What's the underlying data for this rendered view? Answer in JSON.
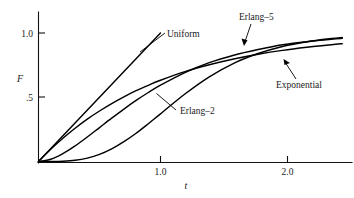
{
  "chart_data": {
    "type": "line",
    "title": "",
    "subtitle": "",
    "xlabel": "t",
    "ylabel": "F",
    "xlim": [
      0,
      2.49
    ],
    "ylim": [
      0,
      1.04
    ],
    "grid": false,
    "legend_position": "inline-annotations",
    "x_ticks": [
      {
        "value": 1.0,
        "label": "1.0"
      },
      {
        "value": 2.0,
        "label": "2.0"
      }
    ],
    "y_ticks": [
      {
        "value": 0.5,
        "label": ".5"
      },
      {
        "value": 1.0,
        "label": "1.0"
      }
    ],
    "series": [
      {
        "name": "Uniform",
        "label": "Uniform",
        "x": [
          0.0,
          0.1,
          0.2,
          0.3,
          0.4,
          0.5,
          0.6,
          0.7,
          0.8,
          0.9,
          1.0
        ],
        "values": [
          0.0,
          0.1,
          0.2,
          0.3,
          0.4,
          0.5,
          0.6,
          0.7,
          0.8,
          0.9,
          1.0
        ]
      },
      {
        "name": "Exponential",
        "label": "Exponential",
        "x": [
          0.0,
          0.1,
          0.2,
          0.3,
          0.4,
          0.5,
          0.6,
          0.7,
          0.8,
          0.9,
          1.0,
          1.2,
          1.4,
          1.6,
          1.8,
          2.0,
          2.2,
          2.4,
          2.49
        ],
        "values": [
          0.0,
          0.095,
          0.181,
          0.259,
          0.33,
          0.393,
          0.451,
          0.503,
          0.551,
          0.593,
          0.632,
          0.699,
          0.753,
          0.798,
          0.835,
          0.865,
          0.889,
          0.909,
          0.917
        ]
      },
      {
        "name": "Erlang-2",
        "label": "Erlang–2",
        "x": [
          0.0,
          0.1,
          0.2,
          0.3,
          0.4,
          0.5,
          0.6,
          0.7,
          0.8,
          0.9,
          1.0,
          1.2,
          1.4,
          1.6,
          1.8,
          2.0,
          2.2,
          2.4,
          2.49
        ],
        "values": [
          0.0,
          0.018,
          0.062,
          0.122,
          0.191,
          0.264,
          0.337,
          0.408,
          0.475,
          0.537,
          0.594,
          0.692,
          0.769,
          0.827,
          0.871,
          0.908,
          0.932,
          0.951,
          0.958
        ]
      },
      {
        "name": "Erlang-5",
        "label": "Erlang–5",
        "x": [
          0.0,
          0.1,
          0.2,
          0.3,
          0.4,
          0.5,
          0.6,
          0.7,
          0.8,
          0.9,
          1.0,
          1.2,
          1.4,
          1.6,
          1.8,
          2.0,
          2.2,
          2.4,
          2.49
        ],
        "values": [
          0.0,
          0.0,
          0.002,
          0.009,
          0.026,
          0.055,
          0.098,
          0.154,
          0.22,
          0.294,
          0.371,
          0.525,
          0.659,
          0.764,
          0.84,
          0.895,
          0.932,
          0.957,
          0.965
        ]
      }
    ],
    "annotations": [
      {
        "text": "Uniform",
        "x_px": 167,
        "y_px": 36
      },
      {
        "text": "Erlang–5",
        "x_px": 239,
        "y_px": 20
      },
      {
        "text": "Exponential",
        "x_px": 276,
        "y_px": 86
      },
      {
        "text": "Erlang–2",
        "x_px": 180,
        "y_px": 113
      }
    ],
    "colors": {
      "curve": "#000000",
      "axis": "#111111",
      "background": "#ffffff",
      "text": "#1a1a1a"
    }
  }
}
